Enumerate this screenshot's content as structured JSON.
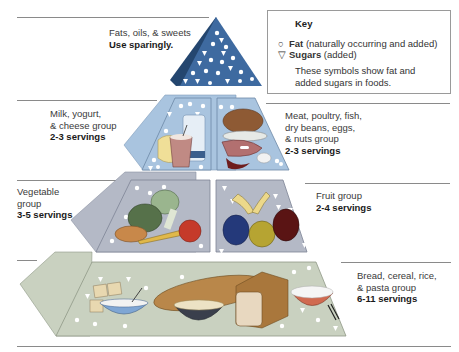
{
  "key": {
    "title": "Key",
    "items": [
      {
        "symbol": "○",
        "icon": "circle-fat-icon",
        "name": "Fat",
        "detail": " (naturally occurring and added)"
      },
      {
        "symbol": "▽",
        "icon": "triangle-sugar-icon",
        "name": "Sugars",
        "detail": " (added)"
      }
    ],
    "description_line1": "These symbols show fat and",
    "description_line2": "added sugars in foods."
  },
  "groups": {
    "fats": {
      "line1": "Fats, oils, & sweets",
      "servings": "Use sparingly."
    },
    "milk": {
      "line1": "Milk, yogurt,",
      "line2": "& cheese group",
      "servings": "2-3 servings"
    },
    "meat": {
      "line1": "Meat, poultry, fish,",
      "line2": "dry beans, eggs,",
      "line3": "& nuts group",
      "servings": "2-3 servings"
    },
    "vegetable": {
      "line1": "Vegetable",
      "line2": "group",
      "servings": "3-5 servings"
    },
    "fruit": {
      "line1": "Fruit group",
      "servings": "2-4 servings"
    },
    "bread": {
      "line1": "Bread, cereal, rice,",
      "line2": "& pasta group",
      "servings": "6-11 servings"
    }
  },
  "colors": {
    "fats_tier": "#3e6aa0",
    "fats_side": "#24466f",
    "milk_meat_tier": "#a9c4df",
    "veg_fruit_tier": "#b4b9c6",
    "bread_tier": "#c9d1c0"
  }
}
